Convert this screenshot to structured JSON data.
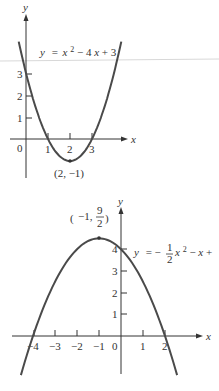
{
  "chart_data": [
    {
      "type": "line",
      "title": "",
      "equation_label": "y = x² − 4x + 3",
      "xlabel": "x",
      "ylabel": "y",
      "x_tick_labels": [
        "0",
        "1",
        "2",
        "3"
      ],
      "y_tick_labels": [
        "1",
        "2",
        "3"
      ],
      "xlim": [
        -0.5,
        4.5
      ],
      "ylim": [
        -1.8,
        4.5
      ],
      "function": {
        "a": 1,
        "b": -4,
        "c": 3
      },
      "x": [
        -0.3,
        0,
        0.5,
        1,
        1.5,
        2,
        2.5,
        3,
        3.5,
        4,
        4.3
      ],
      "y": [
        4.29,
        3,
        1.25,
        0,
        -0.75,
        -1,
        -0.75,
        0,
        1.25,
        3,
        4.29
      ],
      "annotations": [
        {
          "text": "(2, −1)",
          "x": 2,
          "y": -1,
          "note": "vertex"
        }
      ],
      "grid": false
    },
    {
      "type": "line",
      "title": "",
      "equation_label": "y = −½x² − x + 4",
      "xlabel": "x",
      "ylabel": "y",
      "x_tick_labels": [
        "−4",
        "−3",
        "−2",
        "−1",
        "0",
        "1",
        "2"
      ],
      "y_tick_labels": [
        "1",
        "2",
        "3",
        "4"
      ],
      "xlim": [
        -5,
        3.5
      ],
      "ylim": [
        -1.5,
        6
      ],
      "function": {
        "a": -0.5,
        "b": -1,
        "c": 4
      },
      "x": [
        -4.5,
        -4,
        -3,
        -2,
        -1,
        0,
        1,
        2,
        2.6
      ],
      "y": [
        -1.625,
        0,
        2.5,
        4,
        4.5,
        4,
        2.5,
        0,
        -1.98
      ],
      "annotations": [
        {
          "text": "(−1, 9/2)",
          "x": -1,
          "y": 4.5,
          "note": "vertex"
        }
      ],
      "grid": false
    }
  ],
  "top": {
    "axis_y": "y",
    "axis_x": "x",
    "equation": {
      "y": "y",
      "eq": "= ",
      "x": "x",
      "sup": "2",
      "rest": " − 4",
      "x2": "x",
      "tail": " + 3"
    },
    "ticks_x": [
      "0",
      "1",
      "2",
      "3"
    ],
    "ticks_y": [
      "1",
      "2",
      "3"
    ],
    "vertex_label": "(2, −1)"
  },
  "bottom": {
    "axis_y": "y",
    "axis_x": "x",
    "equation": {
      "y": "y",
      "eq": "= −",
      "num": "1",
      "den": "2",
      "x": "x",
      "sup": "2",
      "rest": " − ",
      "x2": "x",
      "tail": " +"
    },
    "ticks_x": [
      "−4",
      "−3",
      "−2",
      "−1",
      "0",
      "1",
      "2"
    ],
    "ticks_y": [
      "1",
      "2",
      "3",
      "4"
    ],
    "vertex": {
      "pre": "−1, ",
      "num": "9",
      "den": "2"
    }
  }
}
